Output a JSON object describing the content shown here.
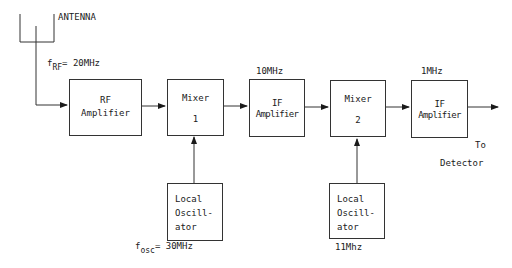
{
  "diagram": {
    "type": "superheterodyne receiver block diagram",
    "antenna_label": "ANTENNA",
    "rf_freq": {
      "symbol": "f",
      "subscript": "RF",
      "value": "= 20MHz"
    },
    "osc_freq": {
      "symbol": "f",
      "subscript": "osc",
      "value": "= 30MHz"
    },
    "blocks": [
      {
        "id": "rf-amp",
        "line1": "RF",
        "line2": "Amplifier"
      },
      {
        "id": "mixer-1",
        "line1": "Mixer",
        "line2": "1"
      },
      {
        "id": "if-amp-1",
        "line1": "IF",
        "line2": "Amplifier",
        "freq_label": "10MHz"
      },
      {
        "id": "mixer-2",
        "line1": "Mixer",
        "line2": "2"
      },
      {
        "id": "if-amp-2",
        "line1": "IF",
        "line2": "Amplifier",
        "freq_label": "1MHz"
      }
    ],
    "oscillators": [
      {
        "id": "lo-1",
        "lines": [
          "Local",
          "Oscill-",
          "ator"
        ]
      },
      {
        "id": "lo-2",
        "lines": [
          "Local",
          "Oscill-",
          "ator"
        ],
        "freq_label": "11Mhz"
      }
    ],
    "output": {
      "line1": "To",
      "line2": "Detector"
    }
  }
}
